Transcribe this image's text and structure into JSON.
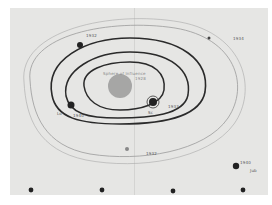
{
  "diagram": {
    "type": "hand-drawn orbital diagram on paper",
    "center": {
      "label": "Sphere of Influence",
      "sublabel": "1928"
    },
    "orbits": [
      {
        "name": "inner-orbit",
        "style": "thick"
      },
      {
        "name": "middle-orbit",
        "style": "thick"
      },
      {
        "name": "outer-orbit",
        "style": "thick"
      },
      {
        "name": "faint-orbit-1",
        "style": "thin"
      },
      {
        "name": "faint-orbit-2",
        "style": "thin"
      }
    ],
    "bodies": [
      {
        "name": "body-top-left",
        "label": "1932"
      },
      {
        "name": "body-left",
        "label": "1940"
      },
      {
        "name": "body-left-prefix",
        "label": "Lo"
      },
      {
        "name": "body-center-right",
        "label": "1933"
      },
      {
        "name": "body-center-right-sub",
        "label": "Sc"
      },
      {
        "name": "body-upper-right",
        "label": "1934"
      },
      {
        "name": "body-bottom",
        "label": "1932"
      },
      {
        "name": "body-lower-right",
        "label": "1940"
      },
      {
        "name": "body-lower-right-sub",
        "label": "Jub"
      }
    ],
    "bottom_dots": 4
  }
}
